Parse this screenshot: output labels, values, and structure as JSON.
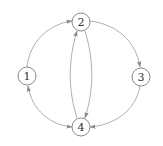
{
  "diagram": {
    "type": "directed-graph",
    "colors": {
      "edge": "#9a9a9a",
      "node_stroke": "#8a8a8a",
      "label": "#333333",
      "background": "#ffffff"
    },
    "nodes": [
      {
        "id": "1",
        "label": "1",
        "x": 27,
        "y": 76
      },
      {
        "id": "2",
        "label": "2",
        "x": 81,
        "y": 22
      },
      {
        "id": "3",
        "label": "3",
        "x": 141,
        "y": 77
      },
      {
        "id": "4",
        "label": "4",
        "x": 81,
        "y": 127
      }
    ],
    "edges": [
      {
        "from": "1",
        "to": "2",
        "bidirectional": false
      },
      {
        "from": "2",
        "to": "3",
        "bidirectional": false
      },
      {
        "from": "3",
        "to": "4",
        "bidirectional": false
      },
      {
        "from": "1",
        "to": "4",
        "bidirectional": true
      },
      {
        "from": "4",
        "to": "2",
        "bidirectional": false
      },
      {
        "from": "2",
        "to": "4",
        "bidirectional": false
      }
    ]
  }
}
